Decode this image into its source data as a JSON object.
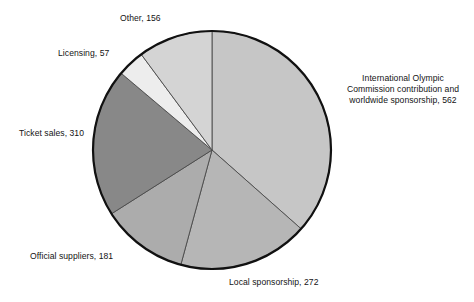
{
  "chart_data": {
    "type": "pie",
    "title": "",
    "subtitle": "",
    "xlabel": "",
    "ylabel": "",
    "legend_position": "none",
    "grid": false,
    "total": 1538,
    "units": "",
    "start_angle_deg": 0,
    "direction": "clockwise",
    "categories": [
      "International Olympic Commission contribution and worldwide sponsorship",
      "Local sponsorship",
      "Official suppliers",
      "Ticket sales",
      "Licensing",
      "Other"
    ],
    "values": [
      562,
      272,
      181,
      310,
      57,
      156
    ],
    "slices": [
      {
        "name": "ioc-contribution",
        "label": "International Olympic Commission contribution and worldwide sponsorship, 562",
        "label_lines": [
          "International Olympic",
          "Commission contribution and",
          "worldwide sponsorship, 562"
        ],
        "category": "International Olympic Commission contribution and worldwide sponsorship",
        "value": 562,
        "percent": 36.5,
        "start_deg": 0,
        "sweep_deg": 131.5,
        "color": "#c6c6c6"
      },
      {
        "name": "local-sponsorship",
        "label": "Local sponsorship, 272",
        "label_lines": [
          "Local sponsorship, 272"
        ],
        "category": "Local sponsorship",
        "value": 272,
        "percent": 17.7,
        "start_deg": 131.5,
        "sweep_deg": 63.7,
        "color": "#b6b6b6"
      },
      {
        "name": "official-suppliers",
        "label": "Official suppliers, 181",
        "label_lines": [
          "Official suppliers, 181"
        ],
        "category": "Official suppliers",
        "value": 181,
        "percent": 11.8,
        "start_deg": 195.2,
        "sweep_deg": 42.4,
        "color": "#acacac"
      },
      {
        "name": "ticket-sales",
        "label": "Ticket sales, 310",
        "label_lines": [
          "Ticket sales, 310"
        ],
        "category": "Ticket sales",
        "value": 310,
        "percent": 20.2,
        "start_deg": 237.6,
        "sweep_deg": 72.6,
        "color": "#888888"
      },
      {
        "name": "licensing",
        "label": "Licensing, 57",
        "label_lines": [
          "Licensing, 57"
        ],
        "category": "Licensing",
        "value": 57,
        "percent": 3.7,
        "start_deg": 310.2,
        "sweep_deg": 13.3,
        "color": "#ededed"
      },
      {
        "name": "other",
        "label": "Other, 156",
        "label_lines": [
          "Other, 156"
        ],
        "category": "Other",
        "value": 156,
        "percent": 10.1,
        "start_deg": 323.5,
        "sweep_deg": 36.5,
        "color": "#d4d4d4"
      }
    ],
    "geometry": {
      "center_x": 212,
      "center_y": 150,
      "radius": 119
    },
    "style": {
      "background": "#ffffff",
      "outline_color": "#111111",
      "divider_color": "#4a4a4a",
      "text_color": "#141414"
    }
  },
  "labels": {
    "ioc_line1": "International Olympic",
    "ioc_line2": "Commission contribution and",
    "ioc_line3": "worldwide sponsorship, 562",
    "local": "Local sponsorship, 272",
    "official": "Official suppliers, 181",
    "ticket": "Ticket sales, 310",
    "licensing": "Licensing, 57",
    "other": "Other, 156"
  }
}
